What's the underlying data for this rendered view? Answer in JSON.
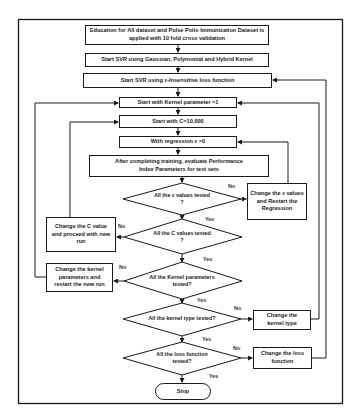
{
  "diagram": {
    "type": "flowchart",
    "nodes": {
      "start_data": "Education for All dataset and Pulse Polio Immunization Dataset is applied with 10 fold cross validation",
      "start_svr_kernels": "Start SVR using Gaussian, Polynomial and Hybrid Kernel",
      "start_svr_loss": "Start SVR using ε-Insensitive loss function",
      "kernel_param_init": "Start with Kernel parameter =1",
      "c_init": "Start with C=10,000",
      "epsilon_init": "With regression ε =0",
      "evaluate": "After completing training, evaluate Performance Index Parameters for test sets",
      "decision_epsilon": "All the ε values tested ?",
      "change_epsilon": "Change the ε values and Restart the Regression",
      "decision_c": "All the C values tested ?",
      "change_c": "Change the C value and proceed with new run",
      "decision_kernel_params": "All the Kernel parameters tested?",
      "change_kernel_params": "Change the kernel parameters and restart the new run",
      "decision_kernel_type": "All the kernel type tested?",
      "change_kernel_type": "Change the kernel type",
      "decision_loss": "All the loss function tested?",
      "change_loss": "Change the loss function",
      "stop": "Stop"
    },
    "edge_labels": {
      "yes": "Yes",
      "no": "No"
    },
    "edges": [
      {
        "from": "start_data",
        "to": "start_svr_kernels"
      },
      {
        "from": "start_svr_kernels",
        "to": "start_svr_loss"
      },
      {
        "from": "start_svr_loss",
        "to": "kernel_param_init"
      },
      {
        "from": "kernel_param_init",
        "to": "c_init"
      },
      {
        "from": "c_init",
        "to": "epsilon_init"
      },
      {
        "from": "epsilon_init",
        "to": "evaluate"
      },
      {
        "from": "evaluate",
        "to": "decision_epsilon"
      },
      {
        "from": "decision_epsilon",
        "to": "change_epsilon",
        "label": "No"
      },
      {
        "from": "change_epsilon",
        "to": "epsilon_init"
      },
      {
        "from": "decision_epsilon",
        "to": "decision_c",
        "label": "Yes"
      },
      {
        "from": "decision_c",
        "to": "change_c",
        "label": "No"
      },
      {
        "from": "change_c",
        "to": "c_init"
      },
      {
        "from": "decision_c",
        "to": "decision_kernel_params",
        "label": "Yes"
      },
      {
        "from": "decision_kernel_params",
        "to": "change_kernel_params",
        "label": "No"
      },
      {
        "from": "change_kernel_params",
        "to": "kernel_param_init"
      },
      {
        "from": "decision_kernel_params",
        "to": "decision_kernel_type",
        "label": "Yes"
      },
      {
        "from": "decision_kernel_type",
        "to": "change_kernel_type",
        "label": "No"
      },
      {
        "from": "change_kernel_type",
        "to": "kernel_param_init"
      },
      {
        "from": "decision_kernel_type",
        "to": "decision_loss",
        "label": "Yes"
      },
      {
        "from": "decision_loss",
        "to": "change_loss",
        "label": "No"
      },
      {
        "from": "change_loss",
        "to": "start_svr_loss"
      },
      {
        "from": "decision_loss",
        "to": "stop",
        "label": "Yes"
      }
    ]
  },
  "colors": {
    "stroke": "#1a1a1a",
    "background": "#ffffff",
    "text": "#222222"
  }
}
